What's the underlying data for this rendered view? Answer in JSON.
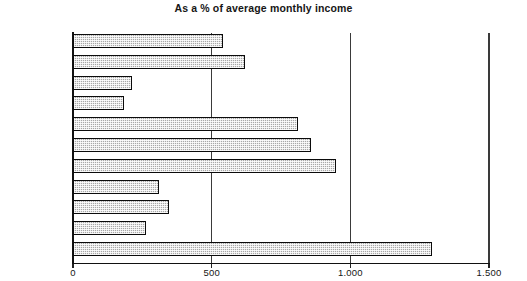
{
  "chart_data": {
    "type": "bar",
    "orientation": "horizontal",
    "title": "As a % of average monthly income",
    "xlabel": "",
    "ylabel": "",
    "xlim": [
      0,
      1500
    ],
    "xticks": [
      0,
      500,
      1000,
      1500
    ],
    "xtick_labels": [
      "0",
      "500",
      "1.000",
      "1.500"
    ],
    "grid": true,
    "grid_axis": "x",
    "legend": false,
    "categories": [
      "Bulgaria",
      "Croatia",
      "Czech Rep.",
      "Hungary",
      "Kazakhstan",
      "Poland",
      "Romania",
      "Russia",
      "Slovakia",
      "Slovenia",
      "Ukraine"
    ],
    "values": [
      540,
      620,
      213,
      184,
      811,
      858,
      949,
      310,
      346,
      263,
      1295
    ],
    "bar_style": {
      "fill": "#a8a8a8",
      "pattern": "checkered-hatch",
      "edge": "#0b0b0b"
    }
  }
}
